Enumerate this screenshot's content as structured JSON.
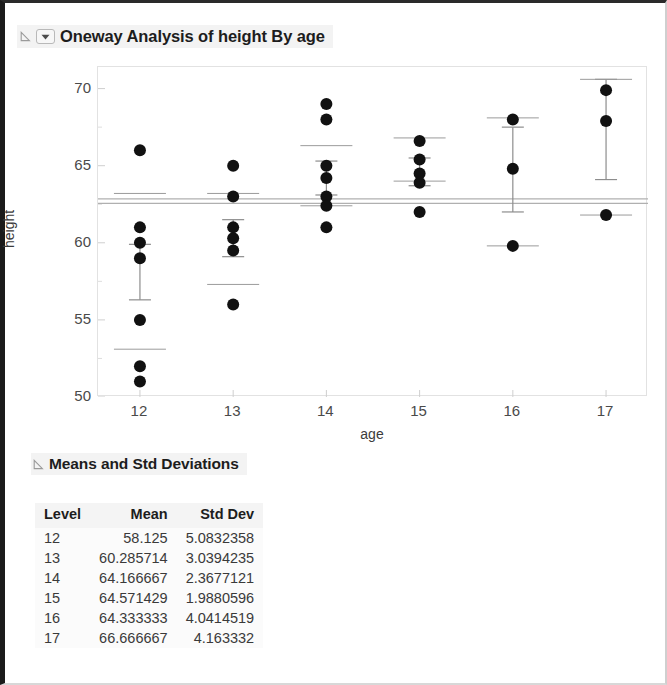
{
  "window": {
    "background": "#ffffff"
  },
  "report": {
    "oneway_header": {
      "title": "Oneway Analysis of height By age",
      "disclosure_icon": "triangle-open-icon",
      "menu_icon": "chevron-down-icon"
    },
    "means_header": {
      "title": "Means and Std Deviations",
      "disclosure_icon": "triangle-open-icon"
    }
  },
  "chart_data": {
    "type": "scatter",
    "title": "Oneway Analysis of height By age",
    "xlabel": "age",
    "ylabel": "height",
    "xlim": [
      11.55,
      17.45
    ],
    "ylim": [
      50,
      71.4
    ],
    "yticks": [
      50,
      55,
      60,
      65,
      70
    ],
    "ytick_labels": [
      "50",
      "55",
      "60",
      "65",
      "70"
    ],
    "y_minor_ticks": [
      52.5,
      57.5,
      62.5,
      67.5
    ],
    "xticks": [
      12,
      13,
      14,
      15,
      16,
      17
    ],
    "xtick_labels": [
      "12",
      "13",
      "14",
      "15",
      "16",
      "17"
    ],
    "grid": false,
    "legend": null,
    "grand_mean": 62.7,
    "grand_mean_lines": [
      62.85,
      62.55
    ],
    "marker": {
      "shape": "circle",
      "color": "#111111",
      "size": 7
    },
    "groups": [
      {
        "level": "12",
        "x": 12,
        "mean": 58.125,
        "std_dev": 5.0832358,
        "n": 8,
        "values": [
          66,
          61,
          60,
          59,
          55,
          52,
          51,
          63.2
        ],
        "points": [
          66,
          61,
          60,
          59,
          55,
          52,
          51
        ],
        "mean_line": 58.1,
        "error_bar": {
          "low": 56.3,
          "high": 59.9
        },
        "top_marker": 63.2,
        "bottom_marker": 53.1
      },
      {
        "level": "13",
        "x": 13,
        "mean": 60.285714,
        "std_dev": 3.0394235,
        "n": 7,
        "points": [
          65,
          63,
          61,
          60.3,
          59.5,
          56
        ],
        "mean_line": 60.3,
        "error_bar": {
          "low": 59.1,
          "high": 61.5
        },
        "top_marker": 63.2,
        "bottom_marker": 57.3
      },
      {
        "level": "14",
        "x": 14,
        "mean": 64.166667,
        "std_dev": 2.3677121,
        "n": 7,
        "points": [
          69,
          68,
          65,
          64.2,
          63,
          62.4,
          61
        ],
        "mean_line": 64.2,
        "error_bar": {
          "low": 63.1,
          "high": 65.3
        },
        "top_marker": 66.3,
        "bottom_marker": 62.4
      },
      {
        "level": "15",
        "x": 15,
        "mean": 64.571429,
        "std_dev": 1.9880596,
        "n": 7,
        "points": [
          66.6,
          65.4,
          64.5,
          63.9,
          62
        ],
        "mean_line": 64.6,
        "error_bar": {
          "low": 63.7,
          "high": 65.5
        },
        "top_marker": 66.8,
        "bottom_marker": 64.0
      },
      {
        "level": "16",
        "x": 16,
        "mean": 64.333333,
        "std_dev": 4.0414519,
        "n": 3,
        "points": [
          68,
          64.8,
          59.8
        ],
        "mean_line": 64.8,
        "error_bar": {
          "low": 62.0,
          "high": 67.5
        },
        "top_marker": 68.1,
        "bottom_marker": 59.8
      },
      {
        "level": "17",
        "x": 17,
        "mean": 66.666667,
        "std_dev": 4.163332,
        "n": 3,
        "points": [
          69.9,
          67.9,
          61.8
        ],
        "mean_line": 67.9,
        "error_bar": {
          "low": 64.1,
          "high": 70.6
        },
        "top_marker": 70.6,
        "bottom_marker": 61.8
      }
    ]
  },
  "means_table": {
    "columns": [
      "Level",
      "Mean",
      "Std Dev"
    ],
    "rows": [
      {
        "level": "12",
        "mean": "58.125",
        "std_dev": "5.0832358"
      },
      {
        "level": "13",
        "mean": "60.285714",
        "std_dev": "3.0394235"
      },
      {
        "level": "14",
        "mean": "64.166667",
        "std_dev": "2.3677121"
      },
      {
        "level": "15",
        "mean": "64.571429",
        "std_dev": "1.9880596"
      },
      {
        "level": "16",
        "mean": "64.333333",
        "std_dev": "4.0414519"
      },
      {
        "level": "17",
        "mean": "66.666667",
        "std_dev": "4.163332"
      }
    ]
  }
}
